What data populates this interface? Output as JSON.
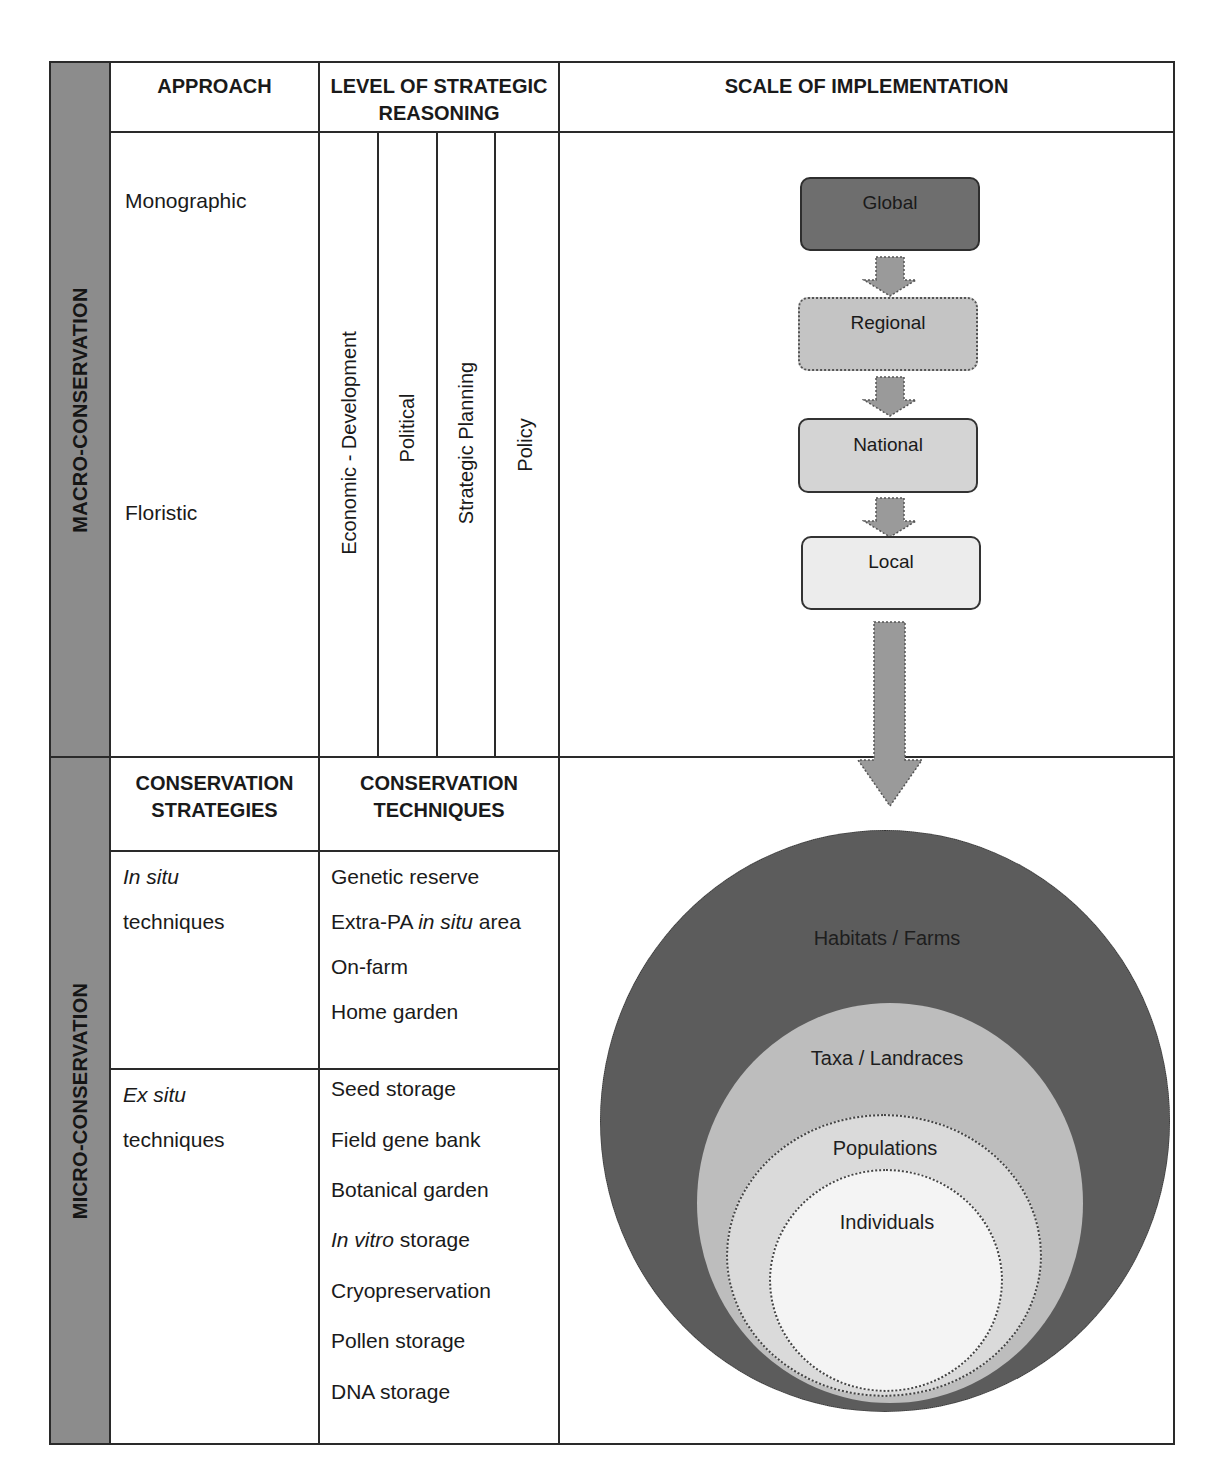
{
  "sections": {
    "macro": "MACRO-CONSERVATION",
    "micro": "MICRO-CONSERVATION"
  },
  "macro": {
    "headers": {
      "approach": "APPROACH",
      "level_line1": "LEVEL OF STRATEGIC",
      "level_line2": "REASONING",
      "scale": "SCALE OF IMPLEMENTATION"
    },
    "approaches": [
      "Monographic",
      "Floristic"
    ],
    "levels": [
      "Economic - Development",
      "Political",
      "Strategic Planning",
      "Policy"
    ],
    "scale_boxes": [
      {
        "label": "Global",
        "fill": "#6e6e6e"
      },
      {
        "label": "Regional",
        "fill": "#c4c4c4"
      },
      {
        "label": "National",
        "fill": "#d4d4d4"
      },
      {
        "label": "Local",
        "fill": "#ececec"
      }
    ]
  },
  "micro": {
    "headers": {
      "strategies_line1": "CONSERVATION",
      "strategies_line2": "STRATEGIES",
      "techniques_line1": "CONSERVATION",
      "techniques_line2": "TECHNIQUES"
    },
    "in_situ": {
      "strategy_italic": "In situ",
      "strategy_rest": "techniques",
      "techniques": [
        {
          "pre": "Genetic reserve",
          "italic": "",
          "post": ""
        },
        {
          "pre": "Extra-PA ",
          "italic": "in situ",
          "post": " area"
        },
        {
          "pre": "On-farm",
          "italic": "",
          "post": ""
        },
        {
          "pre": "Home garden",
          "italic": "",
          "post": ""
        }
      ]
    },
    "ex_situ": {
      "strategy_italic": "Ex situ",
      "strategy_rest": "techniques",
      "techniques": [
        {
          "pre": "Seed storage",
          "italic": "",
          "post": ""
        },
        {
          "pre": "Field gene bank",
          "italic": "",
          "post": ""
        },
        {
          "pre": "Botanical garden",
          "italic": "",
          "post": ""
        },
        {
          "pre": "",
          "italic": "In vitro",
          "post": " storage"
        },
        {
          "pre": "Cryopreservation",
          "italic": "",
          "post": ""
        },
        {
          "pre": "Pollen storage",
          "italic": "",
          "post": ""
        },
        {
          "pre": "DNA storage",
          "italic": "",
          "post": ""
        }
      ]
    },
    "nested_levels": [
      {
        "label": "Habitats / Farms",
        "fill": "#5c5c5c"
      },
      {
        "label": "Taxa / Landraces",
        "fill": "#bdbdbd"
      },
      {
        "label": "Populations",
        "fill": "#dadada"
      },
      {
        "label": "Individuals",
        "fill": "#f4f4f4"
      }
    ]
  },
  "colors": {
    "band": "#8c8c8c",
    "line": "#2a2a2a",
    "arrow": "#9a9a9a"
  }
}
